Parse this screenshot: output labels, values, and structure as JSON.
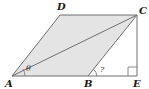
{
  "diagram": {
    "type": "geometry",
    "shape": "parallelogram ABCD with diagonal AC and perpendicular CE to extended AB",
    "colors": {
      "fill": "#e4e4e4",
      "stroke": "#6f6f6f",
      "text": "#1a1a1a"
    },
    "points": {
      "A": {
        "label": "A",
        "x": 12,
        "y": 76
      },
      "B": {
        "label": "B",
        "x": 88,
        "y": 76
      },
      "C": {
        "label": "C",
        "x": 137,
        "y": 15
      },
      "D": {
        "label": "D",
        "x": 60,
        "y": 15
      },
      "E": {
        "label": "E",
        "x": 137,
        "y": 76
      }
    },
    "angles": {
      "at_A": {
        "label": "θ"
      },
      "at_B": {
        "label": "?"
      }
    },
    "right_angle_at": "E"
  }
}
